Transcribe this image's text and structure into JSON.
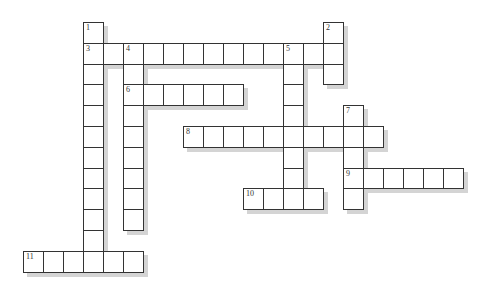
{
  "puzzle": {
    "type": "crossword",
    "grid": {
      "origin_x": 23,
      "origin_y": 22,
      "cell_w": 20,
      "cell_h": 20.8
    },
    "colors": {
      "border": "#333333",
      "cell": "#ffffff",
      "shadow": "#d4d4d4",
      "number": "#333333"
    },
    "entries": [
      {
        "number": "1",
        "direction": "down",
        "row": 0,
        "col": 3,
        "length": 12
      },
      {
        "number": "2",
        "direction": "down",
        "row": 0,
        "col": 15,
        "length": 3
      },
      {
        "number": "3",
        "direction": "across",
        "row": 1,
        "col": 3,
        "length": 13
      },
      {
        "number": "4",
        "direction": "down",
        "row": 1,
        "col": 5,
        "length": 9
      },
      {
        "number": "5",
        "direction": "down",
        "row": 1,
        "col": 13,
        "length": 8
      },
      {
        "number": "6",
        "direction": "across",
        "row": 3,
        "col": 5,
        "length": 6
      },
      {
        "number": "7",
        "direction": "down",
        "row": 4,
        "col": 16,
        "length": 5
      },
      {
        "number": "8",
        "direction": "across",
        "row": 5,
        "col": 8,
        "length": 10
      },
      {
        "number": "9",
        "direction": "across",
        "row": 7,
        "col": 16,
        "length": 6
      },
      {
        "number": "10",
        "direction": "across",
        "row": 8,
        "col": 11,
        "length": 4
      },
      {
        "number": "11",
        "direction": "across",
        "row": 11,
        "col": 0,
        "length": 6
      }
    ]
  }
}
